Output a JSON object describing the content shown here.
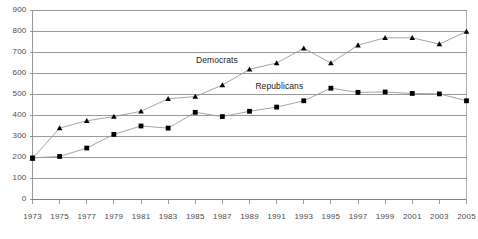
{
  "chart_data": {
    "type": "line",
    "title": "",
    "subtitle": "",
    "xlabel": "",
    "ylabel": "",
    "xlim": [
      1973,
      2005
    ],
    "ylim": [
      0,
      900
    ],
    "grid": true,
    "legend_position": "inline-annotation",
    "x": [
      1973,
      1975,
      1977,
      1979,
      1981,
      1983,
      1985,
      1987,
      1989,
      1991,
      1993,
      1995,
      1997,
      1999,
      2001,
      2003,
      2005
    ],
    "xticklabels": [
      "1973",
      "1975",
      "1977",
      "1979",
      "1981",
      "1983",
      "1985",
      "1987",
      "1989",
      "1991",
      "1993",
      "1995",
      "1997",
      "1999",
      "2001",
      "2003",
      "2005"
    ],
    "yticks": [
      0,
      100,
      200,
      300,
      400,
      500,
      600,
      700,
      800,
      900
    ],
    "yticklabels": [
      "0",
      "100",
      "200",
      "300",
      "400",
      "500",
      "600",
      "700",
      "800",
      "900"
    ],
    "series": [
      {
        "name": "Democrats",
        "marker": "triangle",
        "color": "#000000",
        "values": [
          195,
          340,
          375,
          395,
          420,
          480,
          490,
          545,
          620,
          650,
          720,
          650,
          735,
          770,
          770,
          740,
          800
        ]
      },
      {
        "name": "Republicans",
        "marker": "square",
        "color": "#000000",
        "values": [
          198,
          205,
          245,
          310,
          350,
          340,
          415,
          395,
          420,
          440,
          470,
          530,
          510,
          512,
          505,
          503,
          470
        ]
      }
    ],
    "annotations": [
      {
        "text": "Democrats",
        "x": 1986.6,
        "y": 660
      },
      {
        "text": "Republicans",
        "x": 1991.2,
        "y": 535
      }
    ]
  },
  "axis_style": {
    "gridline_color": "#808080",
    "axis_color": "#808080",
    "line_color": "#999999",
    "marker_color": "#000000",
    "plot_border_color": "#999999"
  }
}
